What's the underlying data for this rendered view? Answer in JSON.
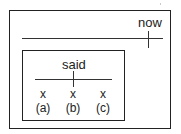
{
  "diagram": {
    "outer_frame": {
      "label": "now",
      "timeline": true
    },
    "inner_frame": {
      "label": "said",
      "events": [
        {
          "mark": "x",
          "label": "(a)"
        },
        {
          "mark": "x",
          "label": "(b)"
        },
        {
          "mark": "x",
          "label": "(c)"
        }
      ]
    }
  }
}
